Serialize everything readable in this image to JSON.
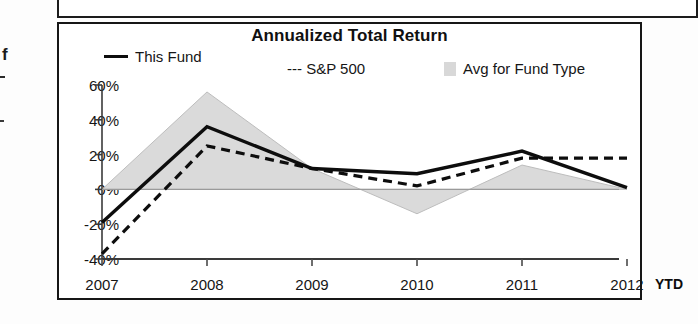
{
  "page": {
    "margin_letter": "f"
  },
  "chart": {
    "title": "Annualized Total Return",
    "legend": [
      {
        "label": "This Fund",
        "marker": "solid-line-swatch"
      },
      {
        "label": "--- S&P 500",
        "marker": "dashed-line-swatch"
      },
      {
        "label": "Avg for Fund Type",
        "marker": "gray-band-swatch"
      }
    ],
    "x_axis_suffix": "YTD"
  },
  "chart_data": {
    "type": "line",
    "title": "Annualized Total Return",
    "xlabel": "",
    "ylabel": "",
    "categories": [
      "2007",
      "2008",
      "2009",
      "2010",
      "2011",
      "2012"
    ],
    "x_tick_labels": [
      "2007",
      "2008",
      "2009",
      "2010",
      "2011",
      "2012"
    ],
    "x_axis_note": "YTD",
    "y_tick_labels": [
      "60%",
      "40%",
      "20%",
      "0%",
      "-20%",
      "-40%"
    ],
    "y_ticks": [
      60,
      40,
      20,
      0,
      -20,
      -40
    ],
    "ylim": [
      -40,
      60
    ],
    "grid": false,
    "legend_position": "top",
    "series": [
      {
        "name": "This Fund",
        "style": "solid",
        "color": "#0d0d0d",
        "values": [
          -19,
          36,
          12,
          9,
          22,
          1
        ]
      },
      {
        "name": "S&P 500",
        "style": "dashed",
        "color": "#0d0d0d",
        "values": [
          -37,
          25,
          12,
          2,
          18,
          18
        ]
      },
      {
        "name": "Avg for Fund Type",
        "style": "filled-band",
        "color": "#d8d8d8",
        "values": [
          0,
          56,
          12,
          -14,
          14,
          0
        ]
      }
    ]
  }
}
